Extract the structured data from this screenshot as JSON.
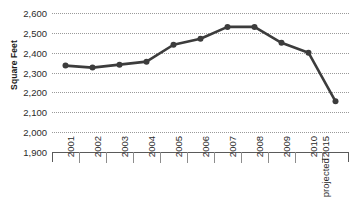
{
  "chart_data": {
    "type": "line",
    "title": "",
    "subtitle": "",
    "xlabel": "",
    "ylabel": "Square Feet",
    "ylim": [
      1900,
      2600
    ],
    "ytick_step": 100,
    "grid": true,
    "legend": "none",
    "categories": [
      "2001",
      "2002",
      "2003",
      "2004",
      "2005",
      "2006",
      "2007",
      "2008",
      "2009",
      "2010",
      "2015 projected"
    ],
    "values": [
      2335,
      2325,
      2340,
      2355,
      2440,
      2470,
      2530,
      2530,
      2450,
      2400,
      2155
    ],
    "series": [
      {
        "name": "Square Feet",
        "values": [
          2335,
          2325,
          2340,
          2355,
          2440,
          2470,
          2530,
          2530,
          2450,
          2400,
          2155
        ]
      }
    ],
    "y_tick_labels": [
      "2,600",
      "2,500",
      "2,400",
      "2,300",
      "2,200",
      "2,100",
      "2,000",
      "1,900"
    ],
    "y_tick_values": [
      2600,
      2500,
      2400,
      2300,
      2200,
      2100,
      2000,
      1900
    ],
    "x_tick_labels": [
      {
        "line1": "2001",
        "line2": ""
      },
      {
        "line1": "2002",
        "line2": ""
      },
      {
        "line1": "2003",
        "line2": ""
      },
      {
        "line1": "2004",
        "line2": ""
      },
      {
        "line1": "2005",
        "line2": ""
      },
      {
        "line1": "2006",
        "line2": ""
      },
      {
        "line1": "2007",
        "line2": ""
      },
      {
        "line1": "2008",
        "line2": ""
      },
      {
        "line1": "2009",
        "line2": ""
      },
      {
        "line1": "2010",
        "line2": ""
      },
      {
        "line1": "2015",
        "line2": "projected"
      }
    ],
    "colors": {
      "line": "#3c3c3c",
      "marker": "#3c3c3c",
      "grid": "#9a9a9a",
      "axis": "#5a5a5a",
      "text": "#2b2b2b",
      "title": "#1b1b1b",
      "background": "#ffffff"
    },
    "style": {
      "line_width_px": 2.6,
      "marker_radius_px": 3.0,
      "marker_shape": "circle",
      "grid_style": "dotted",
      "x_label_rotation_deg": -90
    }
  }
}
